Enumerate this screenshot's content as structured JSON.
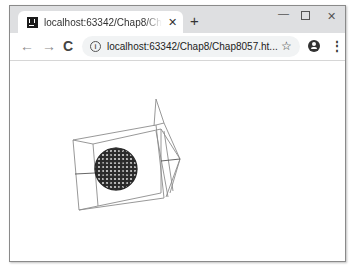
{
  "browser": {
    "tab": {
      "title": "localhost:63342/Chap8/Chap8057.html",
      "close_glyph": "✕"
    },
    "new_tab_glyph": "+",
    "window_controls": {
      "minimize_glyph": "—",
      "close_glyph": "✕"
    },
    "toolbar": {
      "back_glyph": "←",
      "forward_glyph": "→",
      "reload_glyph": "C",
      "info_glyph": "i",
      "url": "localhost:63342/Chap8/Chap8057.ht...",
      "bookmark_glyph": "☆",
      "menu_glyph": "⋮"
    }
  },
  "scene": {
    "description": "Three.js wireframe: box with pyramid cone and wireframe sphere",
    "line_color": "#8c8c8c",
    "sphere_color": "#2a2a2a",
    "sphere": {
      "cx": 115,
      "cy": 168,
      "r": 21
    }
  }
}
